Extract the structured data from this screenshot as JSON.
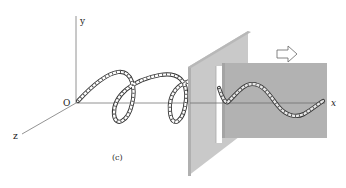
{
  "figure": {
    "caption": "(c)",
    "axes": {
      "origin_label": "O",
      "x_label": "x",
      "y_label": "y",
      "z_label": "z"
    },
    "colors": {
      "background": "#ffffff",
      "front_panel": "#c9c9c9",
      "front_panel_edge": "#b4b4b4",
      "back_panel": "#b2b2b2",
      "axis": "#777777",
      "rope_outline": "#333333",
      "rope_fill": "#ffffff"
    },
    "elements": [
      "3D coordinate axes",
      "helical (circularly polarized) rope wave along x",
      "vertical slit panel (polarizer)",
      "plane-polarized wave on back panel",
      "outline arrow indicating propagation direction"
    ]
  }
}
